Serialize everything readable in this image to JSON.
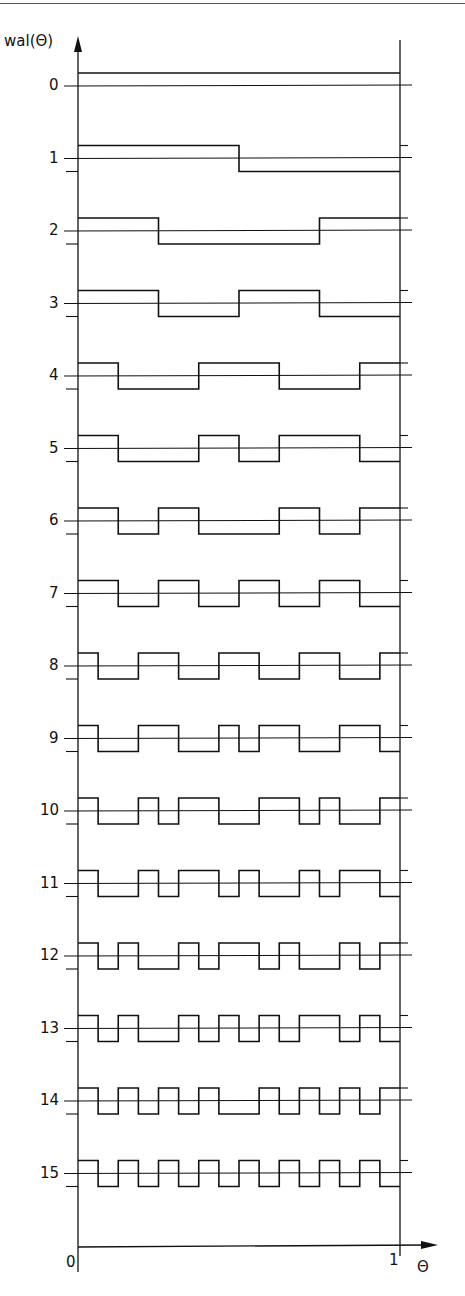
{
  "diagram": {
    "y_axis_label": "wal(Θ)",
    "x_axis_label": "Θ",
    "x_origin_label": "0",
    "x_end_label": "1",
    "row_labels": [
      "0",
      "1",
      "2",
      "3",
      "4",
      "5",
      "6",
      "7",
      "8",
      "9",
      "10",
      "11",
      "12",
      "13",
      "14",
      "15"
    ],
    "functions": 16,
    "ordering": "sequency",
    "line_color": "#111111"
  }
}
